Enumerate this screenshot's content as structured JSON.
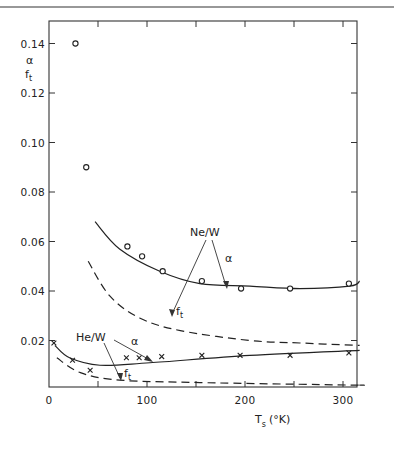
{
  "chart_data": {
    "type": "scatter",
    "title": "",
    "xlabel": "T_s (°K)",
    "xlabel_main": "T",
    "xlabel_sub": "s",
    "xlabel_unit": "(°K)",
    "ylabel_top": "α",
    "ylabel_bottom_main": "f",
    "ylabel_bottom_sub": "t",
    "xlim": [
      0,
      315
    ],
    "ylim": [
      0,
      0.15
    ],
    "grid": false,
    "legend": "none (inline annotations)",
    "x_ticks": [
      0,
      50,
      100,
      150,
      200,
      250,
      300
    ],
    "x_tick_labels": [
      "0",
      "",
      "100",
      "",
      "200",
      "",
      "300"
    ],
    "y_ticks": [
      0.02,
      0.04,
      0.06,
      0.08,
      0.1,
      0.12,
      0.14
    ],
    "y_tick_labels": [
      "0.02",
      "0.04",
      "0.06",
      "0.08",
      "0.10",
      "0.12",
      "0.14"
    ],
    "series": [
      {
        "name": "Ne/W α (measured)",
        "marker": "circle",
        "x": [
          27,
          38,
          80,
          95,
          116,
          156,
          196,
          246,
          306
        ],
        "y": [
          0.14,
          0.09,
          0.058,
          0.054,
          0.048,
          0.044,
          0.041,
          0.041,
          0.043
        ]
      },
      {
        "name": "Ne/W α (theory)",
        "style": "solid",
        "x": [
          47,
          72,
          113,
          154,
          205,
          256,
          307,
          317
        ],
        "y": [
          0.068,
          0.057,
          0.048,
          0.043,
          0.042,
          0.041,
          0.042,
          0.044
        ]
      },
      {
        "name": "Ne/W f_t",
        "style": "dashed",
        "x": [
          40,
          62,
          93,
          134,
          205,
          256,
          317
        ],
        "y": [
          0.052,
          0.038,
          0.029,
          0.024,
          0.02,
          0.019,
          0.018
        ]
      },
      {
        "name": "He/W α (measured)",
        "marker": "cross",
        "x": [
          5,
          24,
          42,
          79,
          92,
          115,
          156,
          195,
          246,
          306
        ],
        "y": [
          0.019,
          0.012,
          0.008,
          0.013,
          0.013,
          0.0135,
          0.014,
          0.014,
          0.014,
          0.015
        ]
      },
      {
        "name": "He/W α (theory)",
        "style": "solid",
        "x": [
          6,
          21,
          52,
          103,
          205,
          317
        ],
        "y": [
          0.018,
          0.013,
          0.01,
          0.011,
          0.014,
          0.016
        ]
      },
      {
        "name": "He/W f_t",
        "style": "dashed",
        "x": [
          8,
          32,
          72,
          154,
          307,
          317
        ],
        "y": [
          0.013,
          0.007,
          0.004,
          0.003,
          0.002,
          0.002
        ]
      }
    ],
    "annotations": [
      {
        "text": "Ne/W",
        "x": 200,
        "y": 0.065
      },
      {
        "text": "α",
        "x": 215,
        "y": 0.052,
        "points_to": "Ne/W solid curve"
      },
      {
        "text": "f_t",
        "x": 130,
        "y": 0.034,
        "points_to": "Ne/W dashed curve"
      },
      {
        "text": "He/W",
        "x": 20,
        "y": 0.023
      },
      {
        "text": "α",
        "x": 90,
        "y": 0.022,
        "points_to": "He/W solid curve"
      },
      {
        "text": "f_t",
        "x": 85,
        "y": 0.006,
        "points_to": "He/W dashed curve"
      }
    ]
  },
  "labels": {
    "ne_w": "Ne/W",
    "he_w": "He/W",
    "alpha": "α",
    "f": "f",
    "t": "t"
  }
}
